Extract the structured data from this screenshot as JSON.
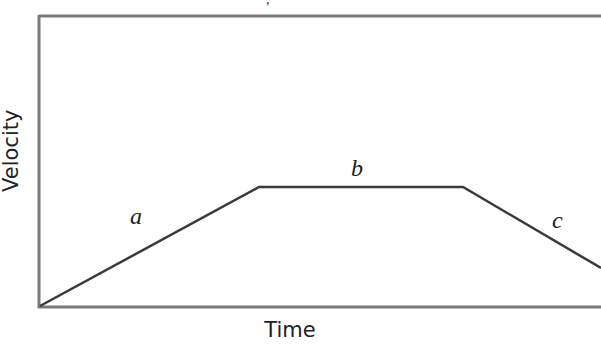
{
  "chart_data": {
    "type": "line",
    "title": "",
    "xlabel": "Time",
    "ylabel": "Velocity",
    "grid": false,
    "legend": null,
    "x": [
      0,
      0.39,
      0.75,
      1.0
    ],
    "values": [
      0,
      0.41,
      0.41,
      0.13
    ],
    "segments": [
      {
        "label": "a",
        "description": "constant acceleration (velocity increases linearly)"
      },
      {
        "label": "b",
        "description": "constant velocity"
      },
      {
        "label": "c",
        "description": "constant deceleration (velocity decreases linearly)"
      }
    ],
    "xlim": [
      0,
      1
    ],
    "ylim": [
      0,
      1
    ],
    "ticks": "none"
  },
  "labels": {
    "x_axis": "Time",
    "y_axis": "Velocity",
    "segment_a": "a",
    "segment_b": "b",
    "segment_c": "c"
  },
  "geometry": {
    "frame": {
      "left": 39,
      "top": 16,
      "bottom": 307
    },
    "points": [
      [
        40,
        306
      ],
      [
        259,
        187
      ],
      [
        463,
        187
      ],
      [
        601,
        268
      ]
    ],
    "line_color": "#3a3a3a",
    "frame_color": "#7a7a7a"
  }
}
